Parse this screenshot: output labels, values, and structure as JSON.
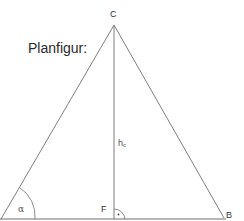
{
  "title": "Planfigur:",
  "vertices": {
    "C": "C",
    "B": "B",
    "F": "F"
  },
  "labels": {
    "altitude": "h",
    "altitude_sub": "c",
    "angle": "α",
    "right_angle_mark": "·"
  },
  "colors": {
    "line": "#707070",
    "text": "#333333"
  }
}
